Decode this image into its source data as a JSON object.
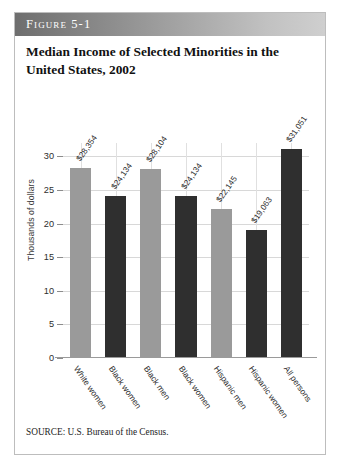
{
  "figure": {
    "band_label": "Figure 5-1",
    "title": "Median Income of Selected Minorities in the United States, 2002",
    "source": "SOURCE: U.S. Bureau of the Census."
  },
  "colors": {
    "bar_light": "#9a9a9a",
    "bar_dark": "#2f2f2f",
    "band_start": "#6e6e6e",
    "band_end": "#cfcfcf",
    "gridline": "#d8d8d8",
    "text": "#1d1d1d"
  },
  "chart_data": {
    "type": "bar",
    "title": "Median Income of Selected Minorities in the United States, 2002",
    "xlabel": "",
    "ylabel": "Thousands of dollars",
    "ylim": [
      0,
      32
    ],
    "yticks": [
      0,
      5,
      10,
      15,
      20,
      25,
      30
    ],
    "ytick_labels": [
      "0",
      "5",
      "10",
      "15",
      "20",
      "25",
      "30"
    ],
    "grid": true,
    "legend": "none",
    "categories": [
      "White women",
      "Black women",
      "Black men",
      "Black women",
      "Hispanic men",
      "Hispanic women",
      "All persons"
    ],
    "values": [
      28.354,
      24.134,
      28.104,
      24.134,
      22.145,
      19.063,
      31.051
    ],
    "value_labels": [
      "$28,354",
      "$24,134",
      "$28,104",
      "$24,134",
      "$22,145",
      "$19,063",
      "$31,051"
    ],
    "bar_shades": [
      "light",
      "dark",
      "light",
      "dark",
      "light",
      "dark",
      "dark"
    ]
  }
}
